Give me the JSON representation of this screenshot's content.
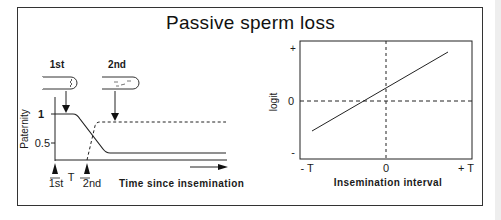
{
  "title": "Passive sperm loss",
  "left_panel": {
    "insemination_labels": {
      "first": "1st",
      "second": "2nd"
    },
    "y_axis": {
      "label": "Paternity",
      "ticks": [
        "1",
        "0.5"
      ]
    },
    "x_axis": {
      "label": "Time since insemination"
    },
    "time_markers": {
      "first": "1st",
      "interval": "T",
      "second": "2nd"
    },
    "series": [
      {
        "name": "1st male",
        "style": "solid",
        "description": "Paternity starts at 1, falls after 2nd insemination to ~0.3"
      },
      {
        "name": "2nd male",
        "style": "dashed",
        "description": "Paternity rises from 0 at 2nd insemination to ~0.85"
      }
    ]
  },
  "right_panel": {
    "y_axis": {
      "label": "logit",
      "ticks": [
        "+",
        "0",
        "-"
      ]
    },
    "x_axis": {
      "label": "Insemination interval",
      "ticks": [
        "- T",
        "0",
        "+ T"
      ]
    },
    "line": {
      "style": "solid",
      "description": "Increasing linear relationship, crossing logit 0 slightly left of interval 0"
    }
  }
}
